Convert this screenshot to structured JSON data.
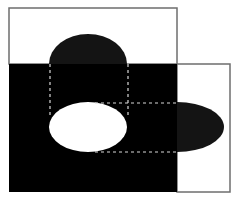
{
  "diagram": {
    "colors": {
      "background": "#ffffff",
      "black_fill": "#000000",
      "dark_shape": "#141414",
      "white_fill": "#ffffff",
      "border": "#6e6e6e",
      "dashed": "#d8d8d8"
    },
    "shapes": {
      "top_rectangle": {
        "fill": "white",
        "border": "gray"
      },
      "black_rectangle": {
        "fill": "black"
      },
      "right_rectangle": {
        "fill": "white",
        "border": "gray"
      },
      "top_half_disc": {
        "fill": "dark"
      },
      "center_ellipse": {
        "fill": "white"
      },
      "right_half_ellipse": {
        "fill": "dark"
      },
      "dashed_lines": {
        "count": 4,
        "style": "dashed"
      }
    }
  }
}
